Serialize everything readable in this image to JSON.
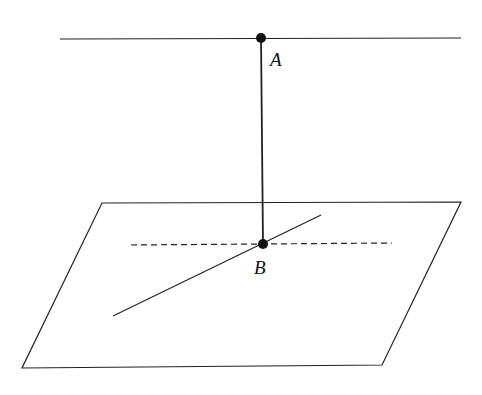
{
  "diagram": {
    "colors": {
      "stroke": "#222222",
      "background": "#ffffff"
    },
    "points": [
      {
        "label": "A",
        "x": 261,
        "y": 38
      },
      {
        "label": "B",
        "x": 263,
        "y": 244
      }
    ],
    "labels": {
      "A": "A",
      "B": "B"
    },
    "lines": {
      "top_line": {
        "x1": 60,
        "y1": 39,
        "x2": 461,
        "y2": 38
      },
      "perpendicular_AB": {
        "x1": 261,
        "y1": 38,
        "x2": 263,
        "y2": 244
      },
      "plane_line_solid": {
        "x1": 113,
        "y1": 316,
        "x2": 321,
        "y2": 215
      },
      "plane_line_dashed": {
        "x1": 131,
        "y1": 245,
        "x2": 392,
        "y2": 243
      }
    },
    "plane": {
      "points": "102,203 461,202 382,365 22,368"
    }
  }
}
